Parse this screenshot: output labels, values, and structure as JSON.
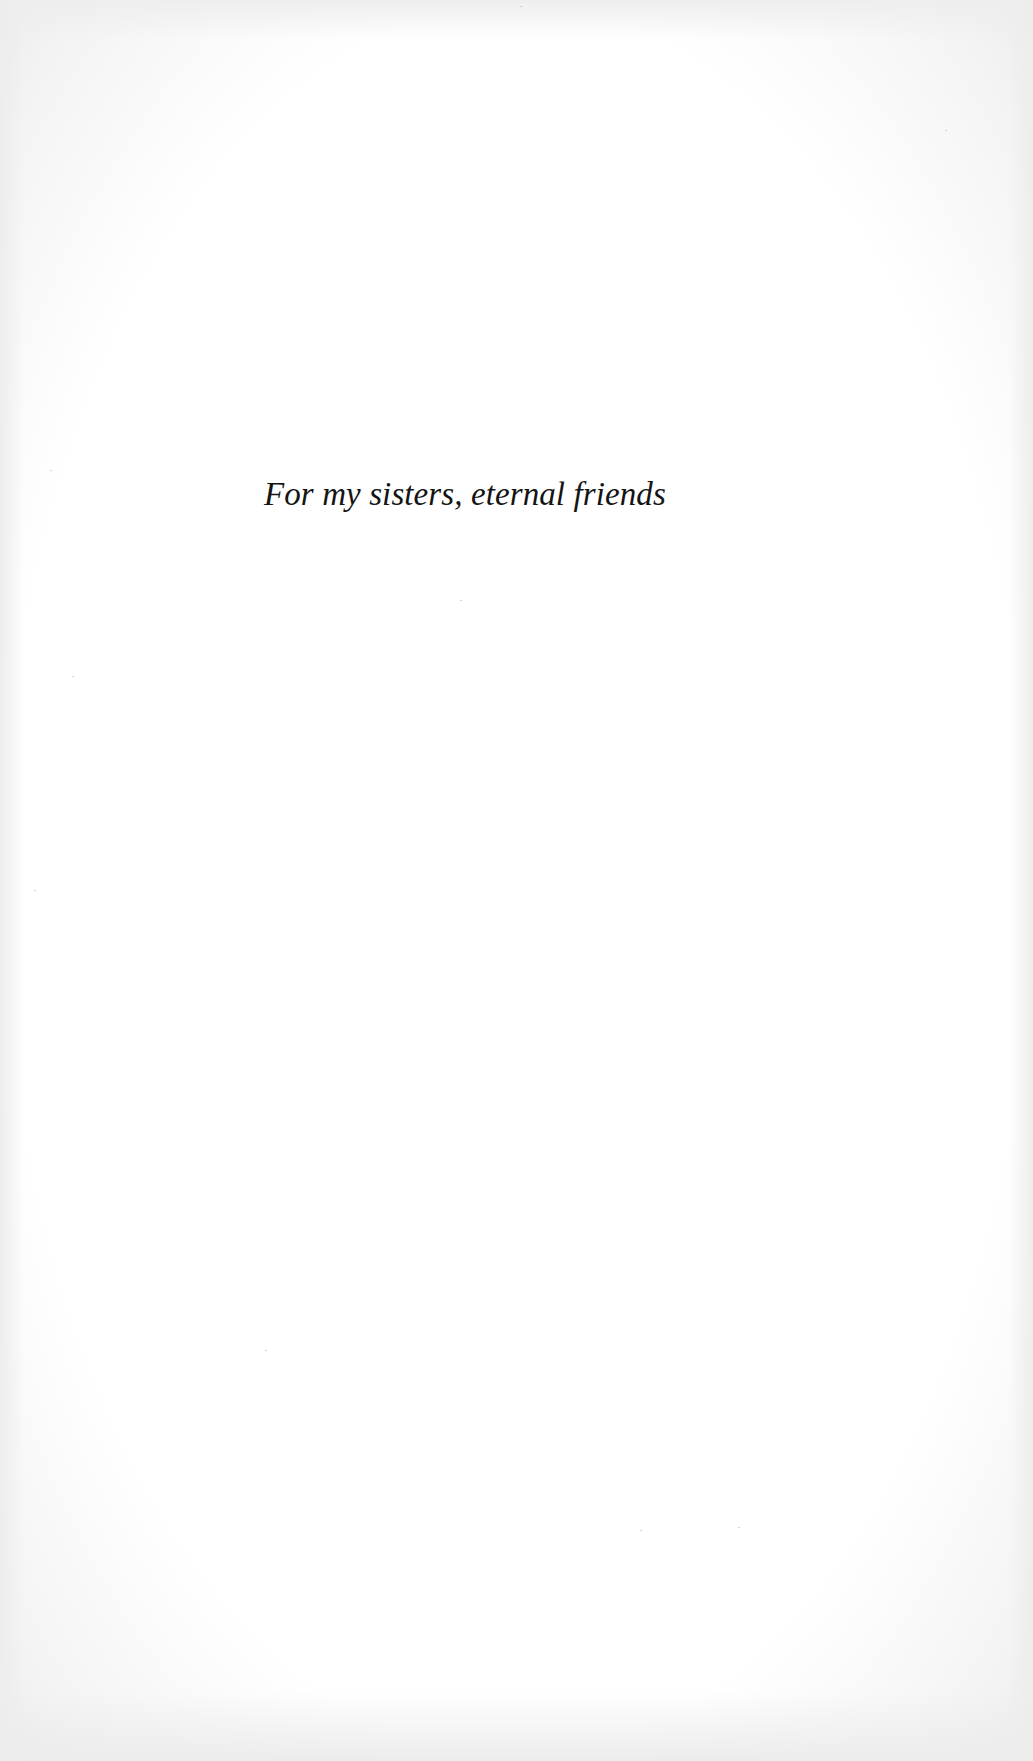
{
  "page": {
    "type": "dedication",
    "background_color": "#fdfdfd",
    "text_color": "#141414"
  },
  "dedication": {
    "text": "For my sisters, eternal friends"
  }
}
